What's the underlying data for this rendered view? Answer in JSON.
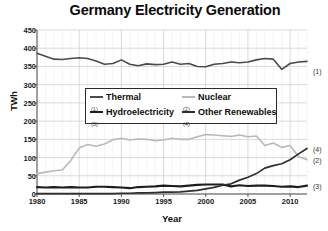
{
  "chart_data": {
    "type": "line",
    "title": "Germany Electricity Generation",
    "xlabel": "Year",
    "ylabel": "TWh",
    "xlim": [
      1980,
      2012
    ],
    "ylim": [
      0,
      450
    ],
    "ytick_step": 50,
    "xtick_step": 5,
    "grid": true,
    "legend_position": "inside-upper-center",
    "yticks": [
      "0",
      "50",
      "100",
      "150",
      "200",
      "250",
      "300",
      "350",
      "400",
      "450"
    ],
    "xticks": [
      "1980",
      "1985",
      "1990",
      "1995",
      "2000",
      "2005",
      "2010"
    ],
    "x": [
      1980,
      1981,
      1982,
      1983,
      1984,
      1985,
      1986,
      1987,
      1988,
      1989,
      1990,
      1991,
      1992,
      1993,
      1994,
      1995,
      1996,
      1997,
      1998,
      1999,
      2000,
      2001,
      2002,
      2003,
      2004,
      2005,
      2006,
      2007,
      2008,
      2009,
      2010,
      2011,
      2012
    ],
    "series": [
      {
        "name": "Thermal",
        "marker_number": "1",
        "color": "#4a4a4a",
        "width": 1.6,
        "values": [
          386,
          378,
          370,
          369,
          372,
          374,
          372,
          365,
          356,
          358,
          368,
          356,
          352,
          357,
          355,
          356,
          362,
          356,
          358,
          350,
          349,
          356,
          358,
          362,
          360,
          362,
          368,
          372,
          370,
          342,
          358,
          362,
          364
        ]
      },
      {
        "name": "Nuclear",
        "marker_number": "2",
        "color": "#b9b9b9",
        "width": 1.6,
        "values": [
          56,
          60,
          64,
          66,
          92,
          126,
          136,
          131,
          137,
          149,
          153,
          148,
          151,
          150,
          146,
          148,
          153,
          150,
          150,
          157,
          163,
          162,
          160,
          158,
          162,
          157,
          159,
          133,
          140,
          128,
          133,
          102,
          94
        ]
      },
      {
        "name": "Hydroelectricity",
        "marker_number": "3",
        "color": "#1d1d1d",
        "width": 2.1,
        "values": [
          19,
          18,
          19,
          18,
          19,
          18,
          18,
          20,
          20,
          19,
          18,
          16,
          19,
          20,
          21,
          23,
          22,
          21,
          23,
          25,
          26,
          26,
          26,
          21,
          24,
          22,
          23,
          23,
          22,
          20,
          21,
          19,
          23
        ]
      },
      {
        "name": "Other Renewables",
        "marker_number": "4",
        "color": "#2e2e2e",
        "width": 1.7,
        "values": [
          1,
          1,
          1,
          1,
          1,
          1,
          1,
          1,
          1,
          1,
          2,
          2,
          3,
          3,
          4,
          5,
          5,
          6,
          8,
          10,
          14,
          18,
          24,
          28,
          38,
          46,
          56,
          71,
          78,
          83,
          94,
          110,
          125
        ]
      }
    ],
    "series_tags": [
      {
        "label": "1",
        "series": "Thermal",
        "x": 313,
        "y": 71
      },
      {
        "label": "4",
        "series": "Other Renewables",
        "x": 313,
        "y": 149
      },
      {
        "label": "2",
        "series": "Nuclear",
        "x": 313,
        "y": 160
      },
      {
        "label": "3",
        "series": "Hydroelectricity",
        "x": 313,
        "y": 186
      }
    ]
  },
  "legend": {
    "entries": [
      {
        "label": "Thermal",
        "number": "1"
      },
      {
        "label": "Nuclear",
        "number": "2"
      },
      {
        "label": "Hydroelectricity",
        "number": "3"
      },
      {
        "label": "Other Renewables",
        "number": "4"
      }
    ]
  },
  "colors": {
    "background": "#ffffff",
    "axis": "#555555",
    "grid_major": "#cfcfcf",
    "grid_minor": "#ededed",
    "text": "#111111"
  }
}
